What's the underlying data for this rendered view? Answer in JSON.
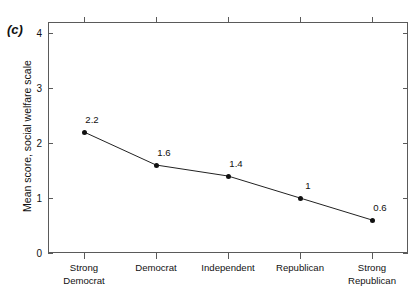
{
  "figure": {
    "panel_letter": "(c)"
  },
  "chart_data": {
    "type": "line",
    "title": "",
    "panel_label": "(c)",
    "xlabel": "",
    "ylabel": "Mean score, social welfare scale",
    "categories": [
      "Strong\nDemocrat",
      "Democrat",
      "Independent",
      "Republican",
      "Strong\nRepublican"
    ],
    "values": [
      2.2,
      1.6,
      1.4,
      1,
      0.6
    ],
    "point_labels": [
      "2.2",
      "1.6",
      "1.4",
      "1",
      "0.6"
    ],
    "ylim": [
      0,
      4.2
    ],
    "yticks": [
      0,
      1,
      2,
      3,
      4
    ],
    "ytick_labels": [
      "0",
      "1",
      "2",
      "3",
      "4"
    ],
    "grid": false,
    "legend": "none",
    "marker": "filled-circle",
    "line_color": "#222222",
    "marker_color": "#111111",
    "frame_color": "#5a5a5a"
  }
}
